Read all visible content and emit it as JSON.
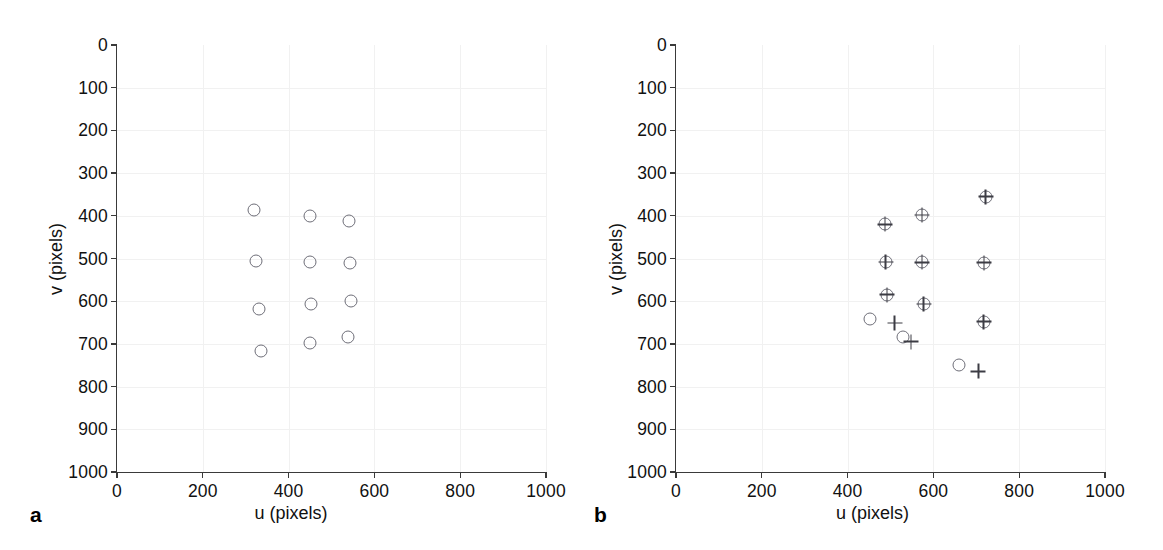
{
  "figure": {
    "panels": [
      {
        "label": "a",
        "xlabel": "u (pixels)",
        "ylabel": "v (pixels)",
        "xticks": [
          0,
          200,
          400,
          600,
          800,
          1000
        ],
        "yticks": [
          0,
          100,
          200,
          300,
          400,
          500,
          600,
          700,
          800,
          900,
          1000
        ]
      },
      {
        "label": "b",
        "xlabel": "u (pixels)",
        "ylabel": "v (pixels)",
        "xticks": [
          0,
          200,
          400,
          600,
          800,
          1000
        ],
        "yticks": [
          0,
          100,
          200,
          300,
          400,
          500,
          600,
          700,
          800,
          900,
          1000
        ]
      }
    ]
  },
  "chart_data": [
    {
      "type": "scatter",
      "title": "",
      "panel": "a",
      "xlabel": "u (pixels)",
      "ylabel": "v (pixels)",
      "xlim": [
        0,
        1000
      ],
      "ylim": [
        0,
        1000
      ],
      "y_axis_inverted": true,
      "grid": true,
      "legend": "none",
      "series": [
        {
          "name": "detected points",
          "marker": "circle",
          "color": "#6e6e78",
          "points": [
            {
              "u": 320,
              "v": 387
            },
            {
              "u": 450,
              "v": 400
            },
            {
              "u": 540,
              "v": 412
            },
            {
              "u": 325,
              "v": 507
            },
            {
              "u": 450,
              "v": 508
            },
            {
              "u": 542,
              "v": 510
            },
            {
              "u": 330,
              "v": 618
            },
            {
              "u": 452,
              "v": 607
            },
            {
              "u": 545,
              "v": 600
            },
            {
              "u": 335,
              "v": 717
            },
            {
              "u": 450,
              "v": 697
            },
            {
              "u": 538,
              "v": 683
            }
          ]
        }
      ]
    },
    {
      "type": "scatter",
      "title": "",
      "panel": "b",
      "xlabel": "u (pixels)",
      "ylabel": "v (pixels)",
      "xlim": [
        0,
        1000
      ],
      "ylim": [
        0,
        1000
      ],
      "y_axis_inverted": true,
      "grid": true,
      "legend": "none",
      "series": [
        {
          "name": "measured points",
          "marker": "circle",
          "color": "#6e6e78",
          "points": [
            {
              "u": 487,
              "v": 420
            },
            {
              "u": 573,
              "v": 398
            },
            {
              "u": 722,
              "v": 355
            },
            {
              "u": 489,
              "v": 508
            },
            {
              "u": 573,
              "v": 509
            },
            {
              "u": 718,
              "v": 510
            },
            {
              "u": 492,
              "v": 585
            },
            {
              "u": 577,
              "v": 607
            },
            {
              "u": 717,
              "v": 648
            },
            {
              "u": 452,
              "v": 641
            },
            {
              "u": 528,
              "v": 683
            },
            {
              "u": 660,
              "v": 750
            }
          ]
        },
        {
          "name": "reprojected points",
          "marker": "plus",
          "color": "#3c3c44",
          "points": [
            {
              "u": 487,
              "v": 420
            },
            {
              "u": 573,
              "v": 398
            },
            {
              "u": 722,
              "v": 355
            },
            {
              "u": 489,
              "v": 508
            },
            {
              "u": 573,
              "v": 509
            },
            {
              "u": 718,
              "v": 510
            },
            {
              "u": 492,
              "v": 585
            },
            {
              "u": 577,
              "v": 607
            },
            {
              "u": 717,
              "v": 648
            },
            {
              "u": 510,
              "v": 651
            },
            {
              "u": 548,
              "v": 695
            },
            {
              "u": 705,
              "v": 764
            }
          ]
        }
      ]
    }
  ]
}
